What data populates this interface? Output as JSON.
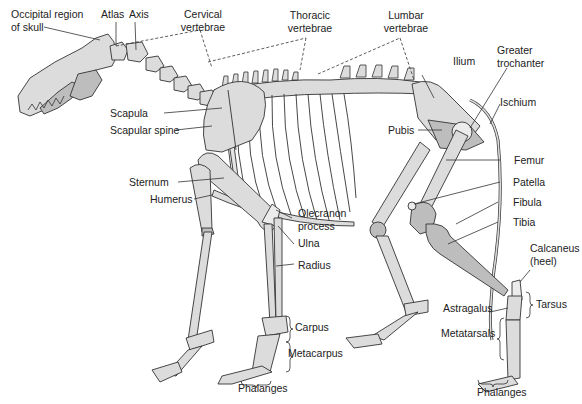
{
  "diagram": {
    "colors": {
      "bone": "#dcdcdc",
      "bone_shade": "#bdbdbd",
      "line": "#333333",
      "background": "#ffffff"
    },
    "labels": {
      "occipital_1": "Occipital region",
      "occipital_2": "of skull",
      "atlas": "Atlas",
      "axis": "Axis",
      "cervical_1": "Cervical",
      "cervical_2": "vertebrae",
      "thoracic_1": "Thoracic",
      "thoracic_2": "vertebrae",
      "lumbar_1": "Lumbar",
      "lumbar_2": "vertebrae",
      "ilium": "Ilium",
      "greater_trochanter_1": "Greater",
      "greater_trochanter_2": "trochanter",
      "ischium": "Ischium",
      "scapula": "Scapula",
      "scapular_spine": "Scapular spine",
      "pubis": "Pubis",
      "femur": "Femur",
      "sternum": "Sternum",
      "humerus": "Humerus",
      "patella": "Patella",
      "fibula": "Fibula",
      "olecranon_1": "Olecranon",
      "olecranon_2": "process",
      "tibia": "Tibia",
      "ulna": "Ulna",
      "calcaneus_1": "Calcaneus",
      "calcaneus_2": "(heel)",
      "radius": "Radius",
      "astragalus": "Astragalus",
      "tarsus": "Tarsus",
      "carpus": "Carpus",
      "metatarsals": "Metatarsals",
      "metacarpus": "Metacarpus",
      "phalanges_front": "Phalanges",
      "phalanges_hind": "Phalanges"
    }
  }
}
